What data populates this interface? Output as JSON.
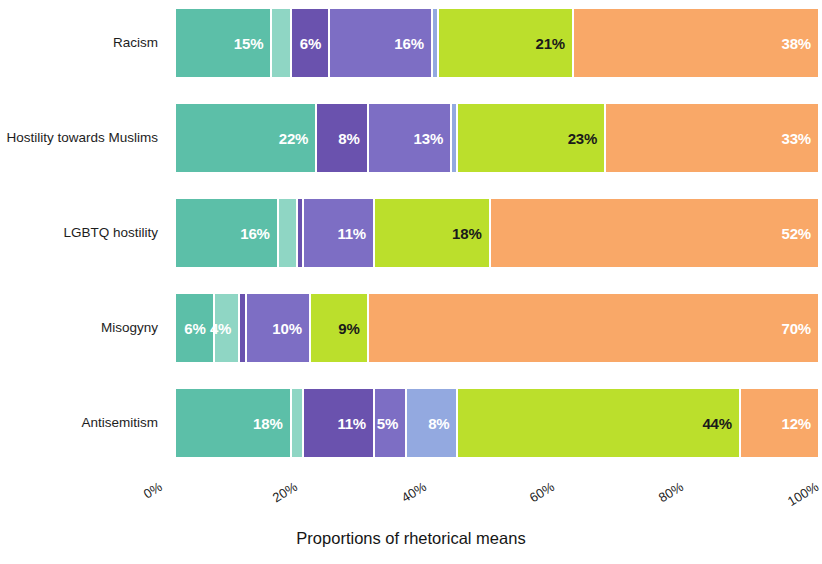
{
  "chart_data": {
    "type": "bar",
    "orientation": "horizontal",
    "stacked": true,
    "normalized_percent": true,
    "title": "",
    "xlabel": "Proportions of rhetorical means",
    "ylabel": "",
    "xlim": [
      0,
      100
    ],
    "xticks": [
      "0%",
      "20%",
      "40%",
      "60%",
      "80%",
      "100%"
    ],
    "xtick_values": [
      0,
      20,
      40,
      60,
      80,
      100
    ],
    "grid": false,
    "legend": "none",
    "categories": [
      "Racism",
      "Hostility towards Muslims",
      "LGBTQ hostility",
      "Misogyny",
      "Antisemitism"
    ],
    "series": [
      {
        "name": "series-1",
        "color": "#5cbfa8",
        "values": [
          15,
          22,
          16,
          6,
          18
        ]
      },
      {
        "name": "series-2",
        "color": "#8fd6c4",
        "values": [
          3,
          0,
          3,
          4,
          2
        ]
      },
      {
        "name": "series-3",
        "color": "#6a52ae",
        "values": [
          6,
          8,
          1,
          1,
          11
        ]
      },
      {
        "name": "series-4",
        "color": "#7d6ec4",
        "values": [
          16,
          13,
          11,
          10,
          5
        ]
      },
      {
        "name": "series-5",
        "color": "#93a9e0",
        "values": [
          1,
          1,
          0,
          0,
          8
        ]
      },
      {
        "name": "series-6",
        "color": "#bbdf2c",
        "values": [
          21,
          23,
          18,
          9,
          44
        ]
      },
      {
        "name": "series-7",
        "color": "#f9a868",
        "values": [
          38,
          33,
          51,
          70,
          12
        ]
      }
    ],
    "bars": [
      {
        "category": "Racism",
        "segments": [
          {
            "value": 15,
            "label": "15%",
            "color": "#5cbfa8",
            "label_color": "white",
            "show_label": true
          },
          {
            "value": 3,
            "label": "",
            "color": "#8fd6c4",
            "label_color": "white",
            "show_label": false
          },
          {
            "value": 6,
            "label": "6%",
            "color": "#6a52ae",
            "label_color": "white",
            "show_label": true
          },
          {
            "value": 16,
            "label": "16%",
            "color": "#7d6ec4",
            "label_color": "white",
            "show_label": true
          },
          {
            "value": 1,
            "label": "",
            "color": "#93a9e0",
            "label_color": "white",
            "show_label": false
          },
          {
            "value": 21,
            "label": "21%",
            "color": "#bbdf2c",
            "label_color": "dark",
            "show_label": true
          },
          {
            "value": 38,
            "label": "38%",
            "color": "#f9a868",
            "label_color": "white",
            "show_label": true
          }
        ]
      },
      {
        "category": "Hostility towards Muslims",
        "segments": [
          {
            "value": 22,
            "label": "22%",
            "color": "#5cbfa8",
            "label_color": "white",
            "show_label": true
          },
          {
            "value": 8,
            "label": "8%",
            "color": "#6a52ae",
            "label_color": "white",
            "show_label": true
          },
          {
            "value": 13,
            "label": "13%",
            "color": "#7d6ec4",
            "label_color": "white",
            "show_label": true
          },
          {
            "value": 1,
            "label": "",
            "color": "#93a9e0",
            "label_color": "white",
            "show_label": false
          },
          {
            "value": 23,
            "label": "23%",
            "color": "#bbdf2c",
            "label_color": "dark",
            "show_label": true
          },
          {
            "value": 33,
            "label": "33%",
            "color": "#f9a868",
            "label_color": "white",
            "show_label": true
          }
        ]
      },
      {
        "category": "LGBTQ hostility",
        "segments": [
          {
            "value": 16,
            "label": "16%",
            "color": "#5cbfa8",
            "label_color": "white",
            "show_label": true
          },
          {
            "value": 3,
            "label": "",
            "color": "#8fd6c4",
            "label_color": "white",
            "show_label": false
          },
          {
            "value": 1,
            "label": "",
            "color": "#6a52ae",
            "label_color": "white",
            "show_label": false
          },
          {
            "value": 11,
            "label": "11%",
            "color": "#7d6ec4",
            "label_color": "white",
            "show_label": true
          },
          {
            "value": 18,
            "label": "18%",
            "color": "#bbdf2c",
            "label_color": "dark",
            "show_label": true
          },
          {
            "value": 51,
            "label": "52%",
            "color": "#f9a868",
            "label_color": "white",
            "show_label": true
          }
        ]
      },
      {
        "category": "Misogyny",
        "segments": [
          {
            "value": 6,
            "label": "6%",
            "color": "#5cbfa8",
            "label_color": "white",
            "show_label": true
          },
          {
            "value": 4,
            "label": "4%",
            "color": "#8fd6c4",
            "label_color": "white",
            "show_label": true
          },
          {
            "value": 1,
            "label": "",
            "color": "#6a52ae",
            "label_color": "white",
            "show_label": false
          },
          {
            "value": 10,
            "label": "10%",
            "color": "#7d6ec4",
            "label_color": "white",
            "show_label": true
          },
          {
            "value": 9,
            "label": "9%",
            "color": "#bbdf2c",
            "label_color": "dark",
            "show_label": true
          },
          {
            "value": 70,
            "label": "70%",
            "color": "#f9a868",
            "label_color": "white",
            "show_label": true
          }
        ]
      },
      {
        "category": "Antisemitism",
        "segments": [
          {
            "value": 18,
            "label": "18%",
            "color": "#5cbfa8",
            "label_color": "white",
            "show_label": true
          },
          {
            "value": 2,
            "label": "",
            "color": "#8fd6c4",
            "label_color": "white",
            "show_label": false
          },
          {
            "value": 11,
            "label": "11%",
            "color": "#6a52ae",
            "label_color": "white",
            "show_label": true
          },
          {
            "value": 5,
            "label": "5%",
            "color": "#7d6ec4",
            "label_color": "white",
            "show_label": true
          },
          {
            "value": 8,
            "label": "8%",
            "color": "#93a9e0",
            "label_color": "white",
            "show_label": true
          },
          {
            "value": 44,
            "label": "44%",
            "color": "#bbdf2c",
            "label_color": "dark",
            "show_label": true
          },
          {
            "value": 12,
            "label": "12%",
            "color": "#f9a868",
            "label_color": "white",
            "show_label": true
          }
        ]
      }
    ]
  },
  "axis": {
    "y_labels": [
      "Racism",
      "Hostility towards Muslims",
      "LGBTQ hostility",
      "Misogyny",
      "Antisemitism"
    ],
    "x_labels": [
      "0%",
      "20%",
      "40%",
      "60%",
      "80%",
      "100%"
    ],
    "x_title": "Proportions of rhetorical means"
  }
}
